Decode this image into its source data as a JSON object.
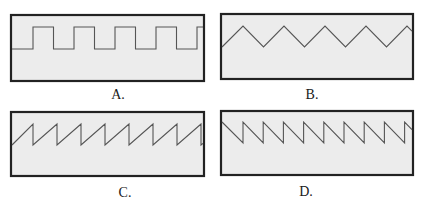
{
  "figure": {
    "colors": {
      "frame": "#222222",
      "panel_fill": "#ececec",
      "waveform": "#555555",
      "label": "#1a1a1a"
    },
    "panels": [
      {
        "id": "A",
        "label": "A.",
        "waveform_type": "square",
        "cycles_visible": 4,
        "starts_at": "low",
        "duty_cycle": 0.5
      },
      {
        "id": "B",
        "label": "B.",
        "waveform_type": "triangle",
        "cycles_visible": 4,
        "starts_at": "low"
      },
      {
        "id": "C",
        "label": "C.",
        "waveform_type": "sawtooth-rising",
        "cycles_visible": 8,
        "starts_at": "low"
      },
      {
        "id": "D",
        "label": "D.",
        "waveform_type": "sawtooth-falling",
        "cycles_visible": 9,
        "starts_at": "high"
      }
    ]
  }
}
